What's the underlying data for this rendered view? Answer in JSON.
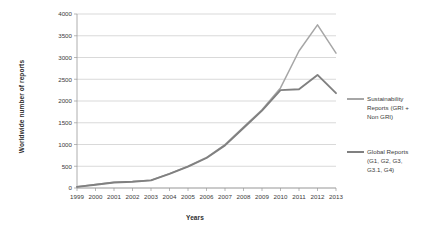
{
  "chart_data": {
    "type": "line",
    "title": "",
    "xlabel": "Years",
    "ylabel": "Worldwide number of reports",
    "categories": [
      "1999",
      "2000",
      "2001",
      "2002",
      "2003",
      "2004",
      "2005",
      "2006",
      "2007",
      "2008",
      "2009",
      "2010",
      "2011",
      "2012",
      "2013"
    ],
    "ylim": [
      0,
      4000
    ],
    "yticks": [
      0,
      500,
      1000,
      1500,
      2000,
      2500,
      3000,
      3500,
      4000
    ],
    "grid": true,
    "legend_position": "right",
    "series": [
      {
        "name": "Sustainability Reports (GRI + Non GRI)",
        "color": "#a6a6a6",
        "values": [
          30,
          80,
          130,
          150,
          180,
          330,
          500,
          700,
          1000,
          1400,
          1800,
          2300,
          3150,
          3750,
          3100
        ]
      },
      {
        "name": "Global Reports (G1, G2, G3, G3.1, G4)",
        "color": "#808080",
        "values": [
          25,
          75,
          125,
          145,
          175,
          325,
          490,
          690,
          980,
          1380,
          1780,
          2250,
          2270,
          2600,
          2180
        ]
      }
    ]
  },
  "axes": {
    "y_title": "Worldwide number of reports",
    "x_title": "Years"
  },
  "legend": {
    "items": [
      {
        "label": "Sustainability\nReports (GRI +\nNon GRI)",
        "color": "#a6a6a6"
      },
      {
        "label": "Global Reports\n(G1, G2, G3,\nG3.1, G4)",
        "color": "#808080"
      }
    ]
  },
  "colors": {
    "grid": "#c9c9c9",
    "axis": "#9a9a9a",
    "tick_text": "#3a3a3a",
    "background": "#ffffff"
  }
}
